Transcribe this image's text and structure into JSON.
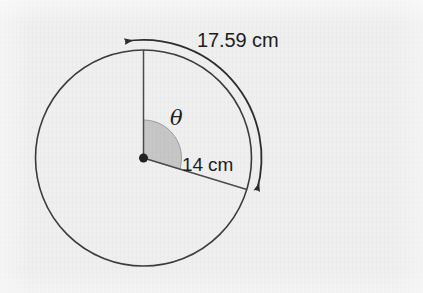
{
  "figure": {
    "kind": "geometry-diagram",
    "background_color": "#efefef",
    "stroke_color": "#3a3a3a",
    "sector_fill_color": "#c6c6c6",
    "text_color": "#1c1c1c"
  },
  "labels": {
    "arc_length": "17.59 cm",
    "radius_length": "14 cm",
    "angle_symbol": "θ"
  },
  "geometry": {
    "center": {
      "x": 143.5,
      "y": 158
    },
    "circle_radius_px": 108,
    "arc_arrow_radius_px": 118,
    "sector_radius_px": 38,
    "vertical_radius_angle_deg": 90,
    "slant_radius_angle_deg": -17,
    "center_dot_radius_px": 4.5,
    "stroke_width_px": 1.6
  },
  "chart_data": {
    "type": "diagram",
    "title": "",
    "shapes": [
      {
        "name": "circle",
        "center": [
          143.5,
          158
        ],
        "radius": 108
      },
      {
        "name": "radius-vertical",
        "from": [
          143.5,
          158
        ],
        "to": [
          143.5,
          50
        ]
      },
      {
        "name": "radius-slanted",
        "from": [
          143.5,
          158
        ],
        "to": [
          246.8,
          126.4
        ]
      },
      {
        "name": "angle-sector",
        "center": [
          143.5,
          158
        ],
        "radius": 38,
        "start_deg": -17,
        "end_deg": 90
      },
      {
        "name": "arc-measure-arrow",
        "center": [
          143.5,
          158
        ],
        "radius": 118,
        "start_deg": -17,
        "end_deg": 99,
        "double_headed": true
      }
    ],
    "annotations": [
      {
        "text": "17.59 cm",
        "role": "arc-length",
        "at": [
          248,
          40
        ]
      },
      {
        "text": "14 cm",
        "role": "radius-length",
        "at": [
          212,
          164
        ]
      },
      {
        "text": "θ",
        "role": "central-angle",
        "at": [
          180,
          118
        ]
      }
    ]
  }
}
